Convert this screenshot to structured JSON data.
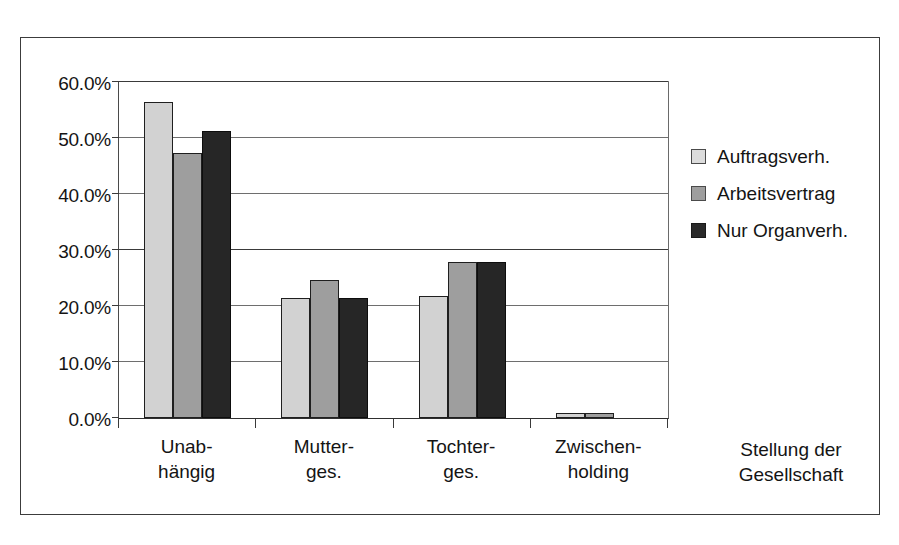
{
  "chart_data": {
    "type": "bar",
    "title": "",
    "subtitle": "",
    "xlabel": "Stellung der Gesellschaft",
    "ylabel": "",
    "categories": [
      "Unab-\nhängig",
      "Mutter-\nges.",
      "Tochter-\nges.",
      "Zwischen-\nholding"
    ],
    "category_lines": [
      [
        "Unab-",
        "hängig"
      ],
      [
        "Mutter-",
        "ges."
      ],
      [
        "Tochter-",
        "ges."
      ],
      [
        "Zwischen-",
        "holding"
      ]
    ],
    "series": [
      {
        "name": "Auftragsverh.",
        "color": "#d2d2d2",
        "values": [
          56.5,
          21.5,
          21.7,
          0.9
        ]
      },
      {
        "name": "Arbeitsvertrag",
        "color": "#9e9e9e",
        "values": [
          47.4,
          24.7,
          27.8,
          0.9
        ]
      },
      {
        "name": "Nur Organverh.",
        "color": "#262626",
        "values": [
          51.3,
          21.4,
          27.9,
          0.0
        ]
      }
    ],
    "ylim": [
      0,
      60
    ],
    "ytick_values": [
      0,
      10,
      20,
      30,
      40,
      50,
      60
    ],
    "ytick_labels": [
      "0.0%",
      "10.0%",
      "20.0%",
      "30.0%",
      "40.0%",
      "50.0%",
      "60.0%"
    ],
    "grid": true,
    "grid_axis": "y",
    "legend_position": "right",
    "value_format": "percent"
  },
  "axis_title": {
    "line1": "Stellung der",
    "line2": "Gesellschaft"
  },
  "colors": {
    "series_light": "#d2d2d2",
    "series_mid": "#9e9e9e",
    "series_dark": "#262626",
    "frame": "#3c3c3c",
    "gridline": "#6e6e6e",
    "text": "#141414",
    "background": "#ffffff"
  }
}
